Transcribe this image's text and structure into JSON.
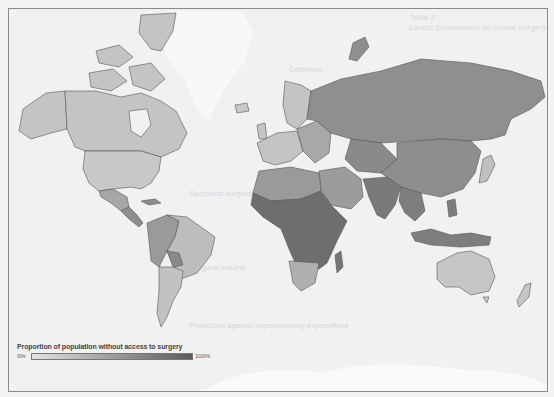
{
  "map": {
    "type": "choropleth-world-map",
    "colors": {
      "ocean": "#f1f1f1",
      "border": "#555555",
      "frame": "#8a8a8a",
      "antarctica": "#fafafa",
      "greenland": "#f8f8f8"
    },
    "regions": [
      {
        "name": "Canada",
        "shade": "#c4c4c4"
      },
      {
        "name": "Alaska",
        "shade": "#c4c4c4"
      },
      {
        "name": "United States",
        "shade": "#c8c8c8"
      },
      {
        "name": "Mexico",
        "shade": "#a6a6a6"
      },
      {
        "name": "Central America",
        "shade": "#8e8e8e"
      },
      {
        "name": "Brazil",
        "shade": "#bdbdbd"
      },
      {
        "name": "Andean South America",
        "shade": "#9a9a9a"
      },
      {
        "name": "Bolivia",
        "shade": "#8a8a8a"
      },
      {
        "name": "Southern Cone",
        "shade": "#c2c2c2"
      },
      {
        "name": "Western Europe",
        "shade": "#c4c4c4"
      },
      {
        "name": "Eastern Europe",
        "shade": "#a8a8a8"
      },
      {
        "name": "Russia",
        "shade": "#8f8f8f"
      },
      {
        "name": "Central Asia",
        "shade": "#8a8a8a"
      },
      {
        "name": "China",
        "shade": "#8e8e8e"
      },
      {
        "name": "Middle East",
        "shade": "#9c9c9c"
      },
      {
        "name": "North Africa",
        "shade": "#9a9a9a"
      },
      {
        "name": "Sub-Saharan Africa",
        "shade": "#6e6e6e"
      },
      {
        "name": "Southern Africa",
        "shade": "#b0b0b0"
      },
      {
        "name": "South Asia",
        "shade": "#7a7a7a"
      },
      {
        "name": "Southeast Asia",
        "shade": "#7e7e7e"
      },
      {
        "name": "Japan",
        "shade": "#c0c0c0"
      },
      {
        "name": "Australia",
        "shade": "#c6c6c6"
      },
      {
        "name": "New Zealand",
        "shade": "#c6c6c6"
      },
      {
        "name": "Madagascar",
        "shade": "#777777"
      },
      {
        "name": "Iceland",
        "shade": "#c8c8c8"
      }
    ]
  },
  "legend": {
    "title": "Proportion of population without access to surgery",
    "min_label": "0%",
    "max_label": "100%",
    "gradient_start": "#e2e2e2",
    "gradient_end": "#5a5a5a"
  },
  "bleed_through_text": [
    "Table 2",
    "Lancet Commission on Global Surgery core indicators",
    "Definition",
    "Specialist surgical workforce density",
    "Surgical volume",
    "Protection against impoverishing expenditure"
  ]
}
